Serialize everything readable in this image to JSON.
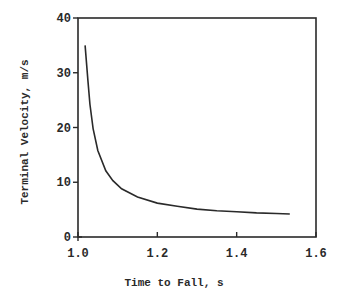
{
  "chart_data": {
    "type": "line",
    "title": "",
    "xlabel": "Time to Fall, s",
    "ylabel": "Terminal Velocity, m/s",
    "xlim": [
      1.0,
      1.6
    ],
    "ylim": [
      0,
      40
    ],
    "xticks": [
      1.0,
      1.2,
      1.4,
      1.6
    ],
    "xtick_labels": [
      "1.0",
      "1.2",
      "1.4",
      "1.6"
    ],
    "yticks": [
      0,
      10,
      20,
      30,
      40
    ],
    "ytick_labels": [
      "0",
      "10",
      "20",
      "30",
      "40"
    ],
    "grid": false,
    "legend": null,
    "series": [
      {
        "name": "terminal velocity",
        "color": "#2a2a2a",
        "x": [
          1.018,
          1.025,
          1.03,
          1.038,
          1.05,
          1.07,
          1.088,
          1.11,
          1.15,
          1.2,
          1.25,
          1.3,
          1.35,
          1.4,
          1.45,
          1.5,
          1.534
        ],
        "y": [
          35.0,
          28.6,
          24.3,
          19.8,
          15.8,
          12.1,
          10.3,
          8.8,
          7.3,
          6.2,
          5.6,
          5.1,
          4.8,
          4.6,
          4.4,
          4.3,
          4.2
        ]
      }
    ]
  }
}
